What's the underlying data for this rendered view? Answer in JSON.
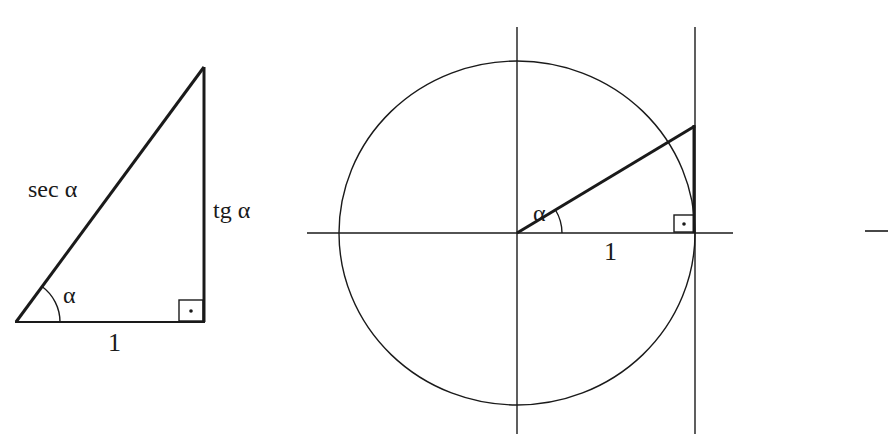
{
  "figure": {
    "colors": {
      "background": "#ffffff",
      "ink": "#1a1a1a"
    }
  },
  "left_triangle": {
    "hypotenuse_label": "sec α",
    "opposite_label": "tg α",
    "adjacent_label": "1",
    "angle_label": "α",
    "right_angle_marker": "square-with-dot"
  },
  "unit_circle": {
    "angle_label": "α",
    "radius_label": "1",
    "right_angle_marker": "square-with-dot"
  },
  "right_edge": {
    "fragment": "partial horizontal line"
  }
}
